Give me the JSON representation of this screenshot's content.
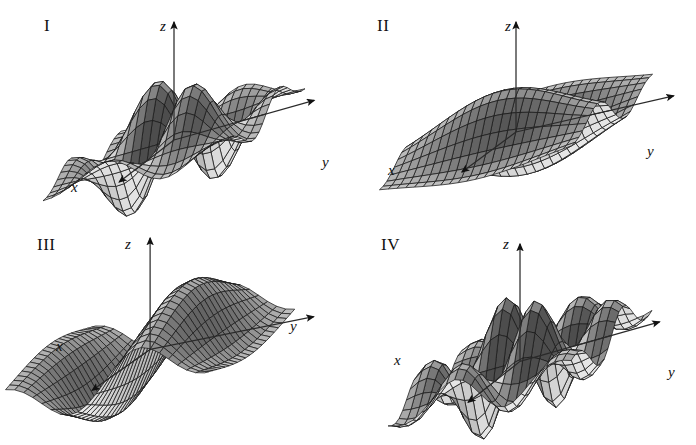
{
  "figure": {
    "background_color": "#ffffff",
    "ink_color": "#111111",
    "panel_count": 4,
    "columns": 2,
    "rows": 2,
    "width": 696,
    "height": 445
  },
  "panels": [
    {
      "id": "panel-I",
      "numeral": "I",
      "axes": {
        "z": "z",
        "y": "y",
        "x": "x"
      },
      "description": "two-way oscillating surface with two tall crests and two deep troughs"
    },
    {
      "id": "panel-II",
      "numeral": "II",
      "axes": {
        "z": "z",
        "y": "y",
        "x": "x"
      },
      "description": "single broad crest with an adjacent trough, gently flattening at the edges"
    },
    {
      "id": "panel-III",
      "numeral": "III",
      "axes": {
        "z": "z",
        "y": "y",
        "x": "x"
      },
      "description": "single ridge and valley running diagonally, flat toward the far corners"
    },
    {
      "id": "panel-IV",
      "numeral": "IV",
      "axes": {
        "z": "z",
        "y": "y",
        "x": "x"
      },
      "description": "two crests and two troughs, narrower and steeper than panel I"
    }
  ],
  "chart_data": {
    "type": "surface",
    "title": "",
    "xlabel": "x",
    "ylabel": "y",
    "zlabel": "z",
    "projection": "oblique-3d-wireframe",
    "shading": "grayscale-lambertian",
    "grid": true,
    "legend": null,
    "surfaces": [
      {
        "name": "I",
        "formula": "sin(x)*sin(y)*exp(-(x*x+y*y)/14)",
        "domain": {
          "x": [
            -4.2,
            4.2
          ],
          "y": [
            -4.2,
            4.2
          ]
        },
        "zrange": [
          -1.0,
          1.0
        ],
        "crests": 2,
        "troughs": 2,
        "nu": 22,
        "nv": 22
      },
      {
        "name": "II",
        "formula": "sin(x)*exp(-(x*x+y*y)/16)",
        "domain": {
          "x": [
            -4.2,
            4.2
          ],
          "y": [
            -4.2,
            4.2
          ]
        },
        "zrange": [
          -0.75,
          0.75
        ],
        "crests": 1,
        "troughs": 1,
        "nu": 22,
        "nv": 22
      },
      {
        "name": "III",
        "formula": "sin(y)*exp(-(x*x+y*y)/22)",
        "domain": {
          "x": [
            -4.2,
            4.2
          ],
          "y": [
            -4.2,
            4.2
          ]
        },
        "zrange": [
          -0.8,
          0.8
        ],
        "crests": 1,
        "troughs": 1,
        "nu": 22,
        "nv": 22
      },
      {
        "name": "IV",
        "formula": "sin(1.25*x)*sin(1.25*y)*exp(-(x*x+y*y)/17)",
        "domain": {
          "x": [
            -4.2,
            4.2
          ],
          "y": [
            -4.2,
            4.2
          ]
        },
        "zrange": [
          -1.0,
          1.0
        ],
        "crests": 2,
        "troughs": 2,
        "nu": 22,
        "nv": 22
      }
    ]
  }
}
